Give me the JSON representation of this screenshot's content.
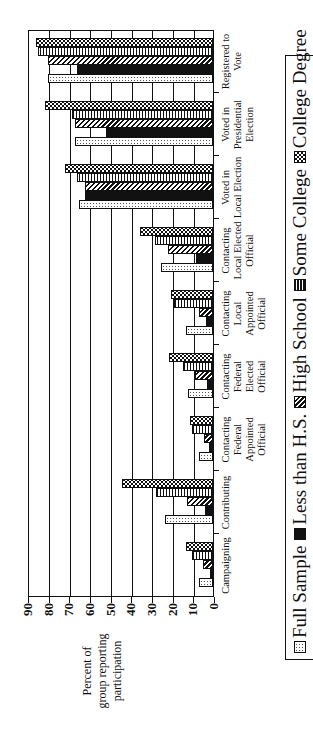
{
  "chart_data": {
    "type": "bar",
    "orientation": "rotated-90-ccw",
    "title": "",
    "ylabel": "Percent of group reporting participation",
    "xlabel": "",
    "ylim": [
      0,
      90
    ],
    "yticks": [
      0,
      10,
      20,
      30,
      40,
      50,
      60,
      70,
      80,
      90
    ],
    "grid": true,
    "legend_position": "bottom",
    "categories": [
      "Campaigning",
      "Contributing",
      "Contacting Federal Appointed Official",
      "Contacting Federal Elected Official",
      "Contacting Local Appointed Official",
      "Contacting Local Elected Official",
      "Voted in Local Election",
      "Voted in Presidential Election",
      "Registered to Vote"
    ],
    "series": [
      {
        "name": "Full Sample",
        "pattern": "dotted",
        "values": [
          7,
          23,
          7,
          12,
          13,
          25,
          65,
          67,
          80
        ]
      },
      {
        "name": "Less than H.S.",
        "pattern": "solid-black",
        "values": [
          1.5,
          4,
          2,
          3,
          3.5,
          8,
          62,
          52,
          66
        ]
      },
      {
        "name": "High School",
        "pattern": "diagonal-hatch",
        "values": [
          5,
          12.5,
          4.5,
          8.5,
          7,
          22,
          62,
          67,
          80
        ]
      },
      {
        "name": "Some College",
        "pattern": "vertical-stripe",
        "values": [
          10,
          27.5,
          10,
          14.5,
          19,
          28,
          66,
          68,
          84.5
        ]
      },
      {
        "name": "College Degree",
        "pattern": "checkered",
        "values": [
          13,
          44,
          11,
          21.5,
          20.5,
          35.5,
          71.5,
          81.5,
          85.5
        ]
      }
    ]
  },
  "axis": {
    "title_lines": [
      "Percent of",
      "group reporting",
      "participation"
    ],
    "ticks": [
      "0",
      "10",
      "20",
      "30",
      "40",
      "50",
      "60",
      "70",
      "80",
      "90"
    ]
  },
  "category_labels": [
    [
      "Campaigning"
    ],
    [
      "Contributing"
    ],
    [
      "Contacting",
      "Federal",
      "Appointed",
      "Official"
    ],
    [
      "Contacting",
      "Federal",
      "Elected",
      "Official"
    ],
    [
      "Contacting",
      "Local",
      "Appointed",
      "Official"
    ],
    [
      "Contacting",
      "Local Elected",
      "Official"
    ],
    [
      "Voted in",
      "Local Election"
    ],
    [
      "Voted in",
      "Presidential",
      "Election"
    ],
    [
      "Registered to",
      "Vote"
    ]
  ],
  "legend": {
    "items": [
      {
        "label": "Full Sample",
        "pattern": "p-full"
      },
      {
        "label": "Less than H.S.",
        "pattern": "p-less"
      },
      {
        "label": "High School",
        "pattern": "p-hs"
      },
      {
        "label": "Some College",
        "pattern": "p-some"
      },
      {
        "label": "College Degree",
        "pattern": "p-college"
      }
    ]
  },
  "colors": {
    "ink": "#111111",
    "background": "#ffffff"
  }
}
